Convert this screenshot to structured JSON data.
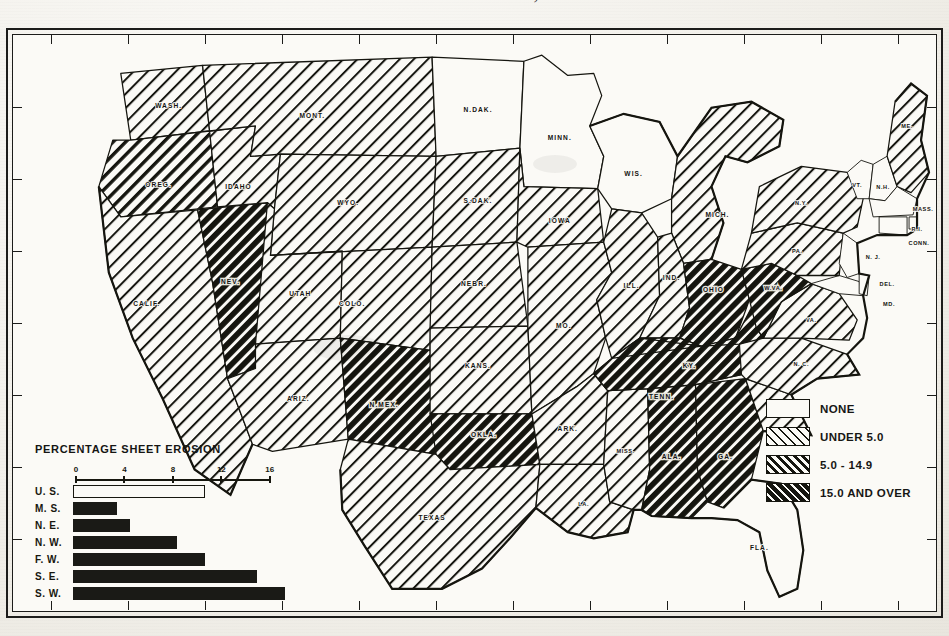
{
  "title": "UNITED STATES, 1934",
  "map_key": {
    "items": [
      {
        "label": "NONE",
        "pattern": "none"
      },
      {
        "label": "UNDER 5.0",
        "pattern": "light"
      },
      {
        "label": "5.0 - 14.9",
        "pattern": "med"
      },
      {
        "label": "15.0 AND OVER",
        "pattern": "dark"
      }
    ]
  },
  "chart_data": {
    "type": "bar",
    "title": "PERCENTAGE SHEET EROSION",
    "orientation": "horizontal",
    "categories": [
      "U. S.",
      "M. S.",
      "N. E.",
      "N. W.",
      "F. W.",
      "S. E.",
      "S. W."
    ],
    "values": [
      10.7,
      3.5,
      4.5,
      8.4,
      10.7,
      15.0,
      17.3
    ],
    "fills": [
      "hollow",
      "filled",
      "filled",
      "filled",
      "filled",
      "filled",
      "filled"
    ],
    "xlabel": "",
    "ylabel": "",
    "xlim": [
      0,
      18
    ],
    "xticks": [
      0,
      4,
      8,
      12,
      16
    ],
    "xtick_labels": [
      "0",
      "4",
      "8",
      "12",
      "16"
    ],
    "grid": false,
    "legend": "none"
  },
  "map": {
    "frame_ticks_top": [
      "125",
      "120",
      "115",
      "110",
      "105",
      "100",
      "95",
      "90",
      "85",
      "80",
      "75",
      "70"
    ],
    "frame_ticks_bottom": [
      "125",
      "120",
      "115",
      "110",
      "105",
      "100",
      "95",
      "90",
      "85",
      "80",
      "75",
      "70"
    ],
    "states": [
      {
        "code": "WASH",
        "label": "WASH.",
        "class": "light"
      },
      {
        "code": "OREG",
        "label": "OREG.",
        "class": "med"
      },
      {
        "code": "IDAHO",
        "label": "IDAHO",
        "class": "light"
      },
      {
        "code": "MONT",
        "label": "MONT.",
        "class": "light"
      },
      {
        "code": "NDAK",
        "label": "N.DAK.",
        "class": "none"
      },
      {
        "code": "SDAK",
        "label": "S.DAK.",
        "class": "light"
      },
      {
        "code": "MINN",
        "label": "MINN.",
        "class": "none"
      },
      {
        "code": "WIS",
        "label": "WIS.",
        "class": "none"
      },
      {
        "code": "MICH",
        "label": "MICH.",
        "class": "light"
      },
      {
        "code": "NEV",
        "label": "NEV.",
        "class": "dark"
      },
      {
        "code": "CALIF",
        "label": "CALIF.",
        "class": "light"
      },
      {
        "code": "UTAH",
        "label": "UTAH",
        "class": "light"
      },
      {
        "code": "ARIZ",
        "label": "ARIZ.",
        "class": "light"
      },
      {
        "code": "WYO",
        "label": "WYO.",
        "class": "light"
      },
      {
        "code": "COLO",
        "label": "COLO.",
        "class": "light"
      },
      {
        "code": "NEBR",
        "label": "NEBR.",
        "class": "light"
      },
      {
        "code": "KANS",
        "label": "KANS.",
        "class": "light"
      },
      {
        "code": "NMEX",
        "label": "N.MEX.",
        "class": "dark"
      },
      {
        "code": "OKLA",
        "label": "OKLA.",
        "class": "dark"
      },
      {
        "code": "TEXAS",
        "label": "TEXAS",
        "class": "light"
      },
      {
        "code": "IOWA",
        "label": "IOWA",
        "class": "light"
      },
      {
        "code": "MO",
        "label": "MO.",
        "class": "light"
      },
      {
        "code": "ARK",
        "label": "ARK.",
        "class": "light"
      },
      {
        "code": "LA",
        "label": "LA.",
        "class": "light"
      },
      {
        "code": "MISS",
        "label": "MISS.",
        "class": "light"
      },
      {
        "code": "ILL",
        "label": "ILL.",
        "class": "light"
      },
      {
        "code": "IND",
        "label": "IND.",
        "class": "light"
      },
      {
        "code": "OHIO",
        "label": "OHIO",
        "class": "dark"
      },
      {
        "code": "KY",
        "label": "KY.",
        "class": "dark"
      },
      {
        "code": "TENN",
        "label": "TENN.",
        "class": "dark"
      },
      {
        "code": "ALA",
        "label": "ALA.",
        "class": "dark"
      },
      {
        "code": "GA",
        "label": "GA.",
        "class": "dark"
      },
      {
        "code": "FLA",
        "label": "FLA.",
        "class": "none"
      },
      {
        "code": "SC",
        "label": "S. C.",
        "class": "light"
      },
      {
        "code": "NC",
        "label": "N. C.",
        "class": "light"
      },
      {
        "code": "VA",
        "label": "VA.",
        "class": "light"
      },
      {
        "code": "WVA",
        "label": "W.VA.",
        "class": "dark"
      },
      {
        "code": "PA",
        "label": "PA.",
        "class": "light"
      },
      {
        "code": "NY",
        "label": "N.Y.",
        "class": "light"
      },
      {
        "code": "ME",
        "label": "ME.",
        "class": "light"
      },
      {
        "code": "VT",
        "label": "VT.",
        "class": "none"
      },
      {
        "code": "NH",
        "label": "N.H.",
        "class": "none"
      },
      {
        "code": "MASS",
        "label": "MASS.",
        "class": "none"
      },
      {
        "code": "RI",
        "label": "R.I.",
        "class": "none"
      },
      {
        "code": "CONN",
        "label": "CONN.",
        "class": "none"
      },
      {
        "code": "NJ",
        "label": "N. J.",
        "class": "none"
      },
      {
        "code": "DEL",
        "label": "DEL.",
        "class": "none"
      },
      {
        "code": "MD",
        "label": "MD.",
        "class": "none"
      }
    ]
  },
  "colors": {
    "ink": "#15150f",
    "paper": "#fbfaf6",
    "page": "#f1efe9"
  }
}
